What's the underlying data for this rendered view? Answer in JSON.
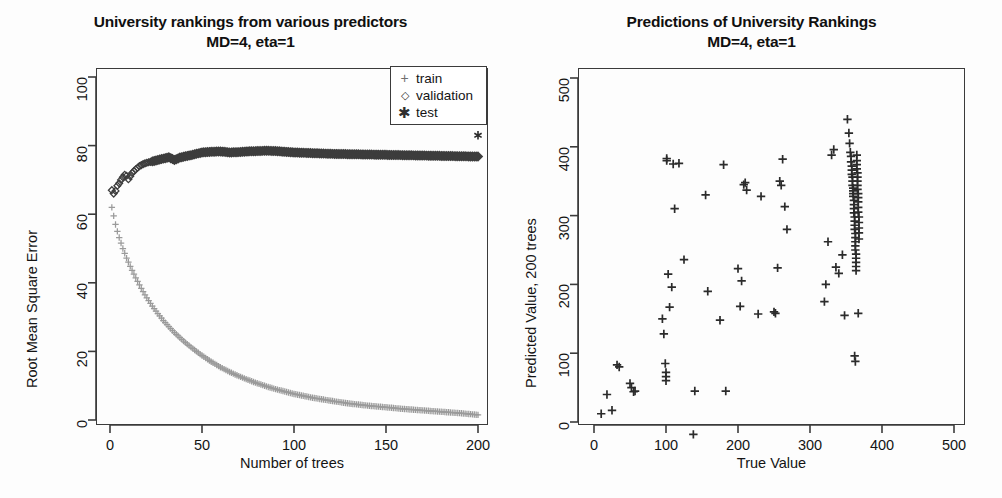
{
  "figure": {
    "background": "#fdfdfd",
    "axis_color": "#3b3b3b",
    "text_color": "#141414"
  },
  "panels": {
    "left": {
      "title_line1": "University rankings from various predictors",
      "title_line2": "MD=4, eta=1",
      "xlabel": "Number of trees",
      "ylabel": "Root Mean Square Error",
      "xticks": [
        "0",
        "50",
        "100",
        "150",
        "200"
      ],
      "yticks": [
        "0",
        "20",
        "40",
        "60",
        "80",
        "100"
      ],
      "legend": {
        "items": [
          {
            "key": "+",
            "marker": "plus-icon",
            "label": "train",
            "color": "#8c8c8c"
          },
          {
            "key": "◇",
            "marker": "diamond-icon",
            "label": "validation",
            "color": "#3d3d3d"
          },
          {
            "key": "✳",
            "marker": "asterisk-icon",
            "label": "test",
            "color": "#2a2a2a"
          }
        ]
      }
    },
    "right": {
      "title_line1": "Predictions of University Rankings",
      "title_line2": "MD=4, eta=1",
      "xlabel": "True Value",
      "ylabel": "Predicted Value, 200 trees",
      "xticks": [
        "0",
        "100",
        "200",
        "300",
        "400",
        "500"
      ],
      "yticks": [
        "0",
        "100",
        "200",
        "300",
        "400",
        "500"
      ]
    }
  },
  "chart_data": [
    {
      "type": "line",
      "id": "rmse-vs-trees",
      "title": "University rankings from various predictors MD=4, eta=1",
      "xlabel": "Number of trees",
      "ylabel": "Root Mean Square Error",
      "xlim": [
        0,
        200
      ],
      "ylim": [
        0,
        100
      ],
      "xticks": [
        0,
        50,
        100,
        150,
        200
      ],
      "yticks": [
        0,
        20,
        40,
        60,
        80,
        100
      ],
      "grid": false,
      "legend_position": "top-right",
      "series": [
        {
          "name": "train",
          "marker": "+",
          "color": "#9a9a9a",
          "x": [
            1,
            2,
            3,
            4,
            5,
            6,
            7,
            8,
            9,
            10,
            12,
            14,
            16,
            18,
            20,
            23,
            26,
            29,
            32,
            35,
            40,
            45,
            50,
            55,
            60,
            65,
            70,
            75,
            80,
            85,
            90,
            95,
            100,
            110,
            120,
            130,
            140,
            150,
            160,
            170,
            180,
            190,
            200
          ],
          "y": [
            62.0,
            59.5,
            57.0,
            55.0,
            53.2,
            51.6,
            50.0,
            48.6,
            47.2,
            46.0,
            43.6,
            41.4,
            39.4,
            37.4,
            35.6,
            33.2,
            31.0,
            29.0,
            27.2,
            25.5,
            23.0,
            20.8,
            18.8,
            17.0,
            15.4,
            14.0,
            12.8,
            11.7,
            10.7,
            9.8,
            9.0,
            8.3,
            7.6,
            6.5,
            5.6,
            4.8,
            4.2,
            3.7,
            3.2,
            2.8,
            2.4,
            2.0,
            1.5
          ]
        },
        {
          "name": "validation",
          "marker": "diamond",
          "color": "#3d3d3d",
          "x": [
            1,
            2,
            3,
            4,
            5,
            6,
            7,
            8,
            9,
            10,
            12,
            14,
            16,
            18,
            20,
            23,
            26,
            29,
            32,
            35,
            38,
            41,
            44,
            47,
            50,
            55,
            60,
            65,
            70,
            75,
            80,
            85,
            90,
            95,
            100,
            110,
            120,
            130,
            140,
            150,
            160,
            170,
            180,
            190,
            200
          ],
          "y": [
            67.0,
            66.0,
            66.8,
            68.3,
            69.0,
            70.0,
            70.8,
            71.5,
            71.2,
            70.2,
            72.0,
            73.1,
            74.0,
            74.6,
            75.0,
            75.4,
            75.8,
            76.2,
            76.6,
            75.8,
            76.5,
            76.9,
            77.2,
            77.6,
            78.0,
            78.2,
            78.3,
            78.0,
            78.1,
            78.3,
            78.4,
            78.5,
            78.4,
            78.2,
            78.0,
            77.8,
            77.6,
            77.5,
            77.4,
            77.3,
            77.2,
            77.1,
            77.0,
            76.9,
            76.8
          ]
        },
        {
          "name": "test",
          "marker": "*",
          "color": "#2a2a2a",
          "x": [
            200
          ],
          "y": [
            83.0
          ]
        }
      ]
    },
    {
      "type": "scatter",
      "id": "predicted-vs-true",
      "title": "Predictions of University Rankings MD=4, eta=1",
      "xlabel": "True Value",
      "ylabel": "Predicted Value, 200 trees",
      "xlim": [
        0,
        520
      ],
      "ylim": [
        -25,
        520
      ],
      "xticks": [
        0,
        100,
        200,
        300,
        400,
        500
      ],
      "yticks": [
        0,
        100,
        200,
        300,
        400,
        500
      ],
      "grid": false,
      "marker": "+",
      "color": "#2b2b2b",
      "points": [
        [
          10,
          12
        ],
        [
          18,
          40
        ],
        [
          25,
          17
        ],
        [
          32,
          83
        ],
        [
          35,
          80
        ],
        [
          50,
          56
        ],
        [
          52,
          50
        ],
        [
          55,
          44
        ],
        [
          57,
          45
        ],
        [
          95,
          150
        ],
        [
          97,
          128
        ],
        [
          99,
          85
        ],
        [
          100,
          72
        ],
        [
          100,
          66
        ],
        [
          100,
          60
        ],
        [
          101,
          383
        ],
        [
          101,
          380
        ],
        [
          103,
          215
        ],
        [
          105,
          167
        ],
        [
          108,
          196
        ],
        [
          110,
          375
        ],
        [
          112,
          310
        ],
        [
          118,
          376
        ],
        [
          125,
          236
        ],
        [
          138,
          -18
        ],
        [
          140,
          45
        ],
        [
          155,
          330
        ],
        [
          158,
          190
        ],
        [
          175,
          148
        ],
        [
          180,
          374
        ],
        [
          183,
          45
        ],
        [
          200,
          223
        ],
        [
          203,
          168
        ],
        [
          205,
          205
        ],
        [
          208,
          345
        ],
        [
          210,
          348
        ],
        [
          212,
          337
        ],
        [
          228,
          157
        ],
        [
          232,
          328
        ],
        [
          250,
          160
        ],
        [
          252,
          158
        ],
        [
          255,
          224
        ],
        [
          258,
          350
        ],
        [
          260,
          344
        ],
        [
          262,
          382
        ],
        [
          265,
          313
        ],
        [
          268,
          280
        ],
        [
          320,
          175
        ],
        [
          322,
          200
        ],
        [
          325,
          262
        ],
        [
          330,
          388
        ],
        [
          333,
          396
        ],
        [
          336,
          225
        ],
        [
          340,
          216
        ],
        [
          345,
          243
        ],
        [
          348,
          155
        ],
        [
          352,
          440
        ],
        [
          354,
          420
        ],
        [
          355,
          405
        ],
        [
          356,
          392
        ],
        [
          357,
          386
        ],
        [
          357,
          378
        ],
        [
          358,
          372
        ],
        [
          358,
          366
        ],
        [
          358,
          360
        ],
        [
          359,
          356
        ],
        [
          359,
          350
        ],
        [
          359,
          344
        ],
        [
          360,
          340
        ],
        [
          360,
          336
        ],
        [
          360,
          332
        ],
        [
          360,
          328
        ],
        [
          361,
          322
        ],
        [
          361,
          316
        ],
        [
          361,
          310
        ],
        [
          361,
          304
        ],
        [
          362,
          298
        ],
        [
          362,
          292
        ],
        [
          362,
          286
        ],
        [
          362,
          280
        ],
        [
          363,
          274
        ],
        [
          363,
          268
        ],
        [
          363,
          262
        ],
        [
          363,
          256
        ],
        [
          363,
          250
        ],
        [
          364,
          244
        ],
        [
          364,
          238
        ],
        [
          364,
          232
        ],
        [
          364,
          226
        ],
        [
          364,
          220
        ],
        [
          365,
          388
        ],
        [
          365,
          380
        ],
        [
          365,
          374
        ],
        [
          365,
          368
        ],
        [
          366,
          362
        ],
        [
          366,
          356
        ],
        [
          366,
          350
        ],
        [
          366,
          344
        ],
        [
          366,
          338
        ],
        [
          367,
          332
        ],
        [
          367,
          326
        ],
        [
          367,
          320
        ],
        [
          367,
          312
        ],
        [
          367,
          305
        ],
        [
          368,
          298
        ],
        [
          368,
          290
        ],
        [
          368,
          282
        ],
        [
          368,
          275
        ],
        [
          368,
          266
        ],
        [
          362,
          96
        ],
        [
          363,
          88
        ],
        [
          367,
          158
        ]
      ]
    }
  ]
}
